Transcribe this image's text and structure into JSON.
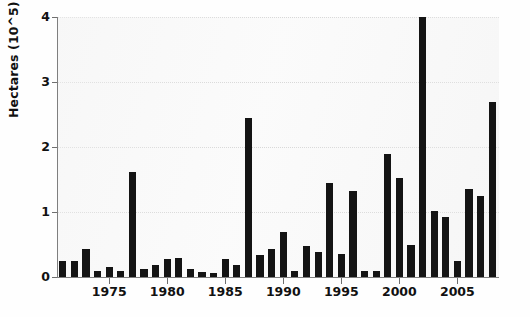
{
  "chart_data": {
    "type": "bar",
    "title": "",
    "xlabel": "",
    "ylabel": "Hectares (10^5)",
    "ylim": [
      0,
      4
    ],
    "xlim": [
      1970.5,
      2008.5
    ],
    "grid": true,
    "legend": null,
    "bar_color": "#141414",
    "background_color": "#fbfbfb",
    "ytick_labels": [
      "0",
      "1",
      "2",
      "3",
      "4"
    ],
    "ytick_values": [
      0,
      1,
      2,
      3,
      4
    ],
    "xtick_labels": [
      "1975",
      "1980",
      "1985",
      "1990",
      "1995",
      "2000",
      "2005"
    ],
    "xtick_values": [
      1975,
      1980,
      1985,
      1990,
      1995,
      2000,
      2005
    ],
    "categories": [
      1971,
      1972,
      1973,
      1974,
      1975,
      1976,
      1977,
      1978,
      1979,
      1980,
      1981,
      1982,
      1983,
      1984,
      1985,
      1986,
      1987,
      1988,
      1989,
      1990,
      1991,
      1992,
      1993,
      1994,
      1995,
      1996,
      1997,
      1998,
      1999,
      2000,
      2001,
      2002,
      2003,
      2004,
      2005,
      2006,
      2007,
      2008
    ],
    "values": [
      0.24,
      0.25,
      0.43,
      0.1,
      0.16,
      0.1,
      1.62,
      0.13,
      0.18,
      0.28,
      0.3,
      0.12,
      0.08,
      0.06,
      0.27,
      0.18,
      2.45,
      0.34,
      0.43,
      0.69,
      0.1,
      0.48,
      0.38,
      1.45,
      0.35,
      1.33,
      0.1,
      0.09,
      1.9,
      1.53,
      0.5,
      4.0,
      1.02,
      0.93,
      0.25,
      1.35,
      1.24,
      2.7
    ]
  }
}
